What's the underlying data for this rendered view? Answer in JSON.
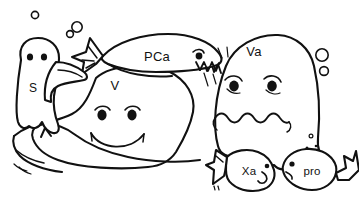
{
  "illustration": {
    "title": "Coagulation cartoon characters",
    "style": "hand-drawn black ink line art on white",
    "background_color": "#ffffff",
    "ink_color": "#111111",
    "width": 359,
    "height": 205
  },
  "characters": [
    {
      "id": "protein-s",
      "label": "S",
      "shape": "small ghost blob with tentacle feet",
      "label_x": 33,
      "label_y": 89,
      "expression": "neutral two-dot eyes"
    },
    {
      "id": "protein-ca",
      "label": "PCa",
      "shape": "fish with tail at left and mouth at right",
      "label_x": 157,
      "label_y": 58,
      "expression": "toothy grin"
    },
    {
      "id": "factor-v",
      "label": "V",
      "shape": "large rounded blob",
      "label_x": 115,
      "label_y": 87,
      "expression": "smiling"
    },
    {
      "id": "factor-va",
      "label": "Va",
      "shape": "large rounded blob with torn top",
      "label_x": 254,
      "label_y": 53,
      "expression": "worried wavy mouth"
    },
    {
      "id": "factor-xa",
      "label": "Xa",
      "shape": "small fish",
      "label_x": 249,
      "label_y": 172,
      "expression": "small eye and mouth"
    },
    {
      "id": "prothrombin",
      "label": "pro",
      "shape": "small fish",
      "label_x": 312,
      "label_y": 172,
      "expression": "small eye and mouth"
    }
  ],
  "bubbles": [
    {
      "id": "bubble-1",
      "cx": 35,
      "cy": 15,
      "r": 3.6
    },
    {
      "id": "bubble-2",
      "cx": 70,
      "cy": 34,
      "r": 3.4
    },
    {
      "id": "bubble-3",
      "cx": 77,
      "cy": 27,
      "r": 5.2
    },
    {
      "id": "bubble-4",
      "cx": 322,
      "cy": 55,
      "r": 6.2
    },
    {
      "id": "bubble-5",
      "cx": 324,
      "cy": 71,
      "r": 4.4
    }
  ],
  "specks": [
    {
      "id": "speck-1",
      "cx": 311,
      "cy": 136,
      "r": 1.9
    },
    {
      "id": "speck-2",
      "cx": 307,
      "cy": 148,
      "r": 1.5
    },
    {
      "id": "speck-3",
      "cx": 316,
      "cy": 146,
      "r": 1.3
    }
  ]
}
